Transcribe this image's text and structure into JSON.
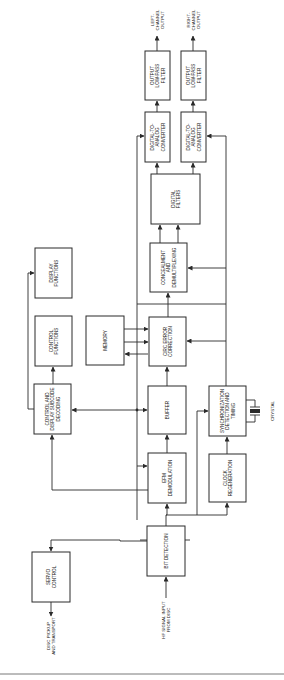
{
  "diagram": {
    "orientation": "rotated 90 degrees counter-clockwise",
    "blocks": [
      {
        "id": "servo_control",
        "lines": [
          "SERVO",
          "CONTROL"
        ]
      },
      {
        "id": "bit_detection",
        "lines": [
          "BIT DETECTION"
        ]
      },
      {
        "id": "efm_demodulation",
        "lines": [
          "EFM",
          "DEMODULATION"
        ]
      },
      {
        "id": "clock_regeneration",
        "lines": [
          "CLOCK",
          "REGENERATION"
        ]
      },
      {
        "id": "buffer",
        "lines": [
          "BUFFER"
        ]
      },
      {
        "id": "sync_detection",
        "lines": [
          "SYNCHRONIZATION",
          "DETECTION AND",
          "TIMING"
        ]
      },
      {
        "id": "control_display_decoding",
        "lines": [
          "CONTROL AND",
          "DISPLAY SUBCODE",
          "DECODING"
        ]
      },
      {
        "id": "control_functions",
        "lines": [
          "CONTROL",
          "FUNCTIONS"
        ]
      },
      {
        "id": "display_functions",
        "lines": [
          "DISPLAY",
          "FUNCTIONS"
        ]
      },
      {
        "id": "memory",
        "lines": [
          "MEMORY"
        ]
      },
      {
        "id": "circ_error_correction",
        "lines": [
          "CIRC ERROR",
          "CORRECTION"
        ]
      },
      {
        "id": "concealment_demux",
        "lines": [
          "CONCEALMENT",
          "AND",
          "DEMULTIPLEXING"
        ]
      },
      {
        "id": "digital_filters",
        "lines": [
          "DIGITAL",
          "FILTERS"
        ]
      },
      {
        "id": "dac_left",
        "lines": [
          "DIGITAL-TO-",
          "ANALOG",
          "CONVERTER"
        ]
      },
      {
        "id": "dac_right",
        "lines": [
          "DIGITAL-TO-",
          "ANALOG",
          "CONVERTER"
        ]
      },
      {
        "id": "lpf_left",
        "lines": [
          "OUTPUT",
          "LOW-PASS",
          "FILTER"
        ]
      },
      {
        "id": "lpf_right",
        "lines": [
          "OUTPUT",
          "LOW-PASS",
          "FILTER"
        ]
      }
    ],
    "external_labels": {
      "disc_pickup": [
        "DISC PICKUP",
        "AND TRANSPORT"
      ],
      "rf_input": [
        "HF SIGNAL INPUT",
        "FROM DISC"
      ],
      "crystal": [
        "CRYSTAL"
      ],
      "left_output": [
        "LEFT-",
        "CHANNEL",
        "OUTPUT"
      ],
      "right_output": [
        "RIGHT-",
        "CHANNEL",
        "OUTPUT"
      ]
    },
    "colors": {
      "line": "#2a2a2a",
      "background": "#ffffff"
    }
  }
}
